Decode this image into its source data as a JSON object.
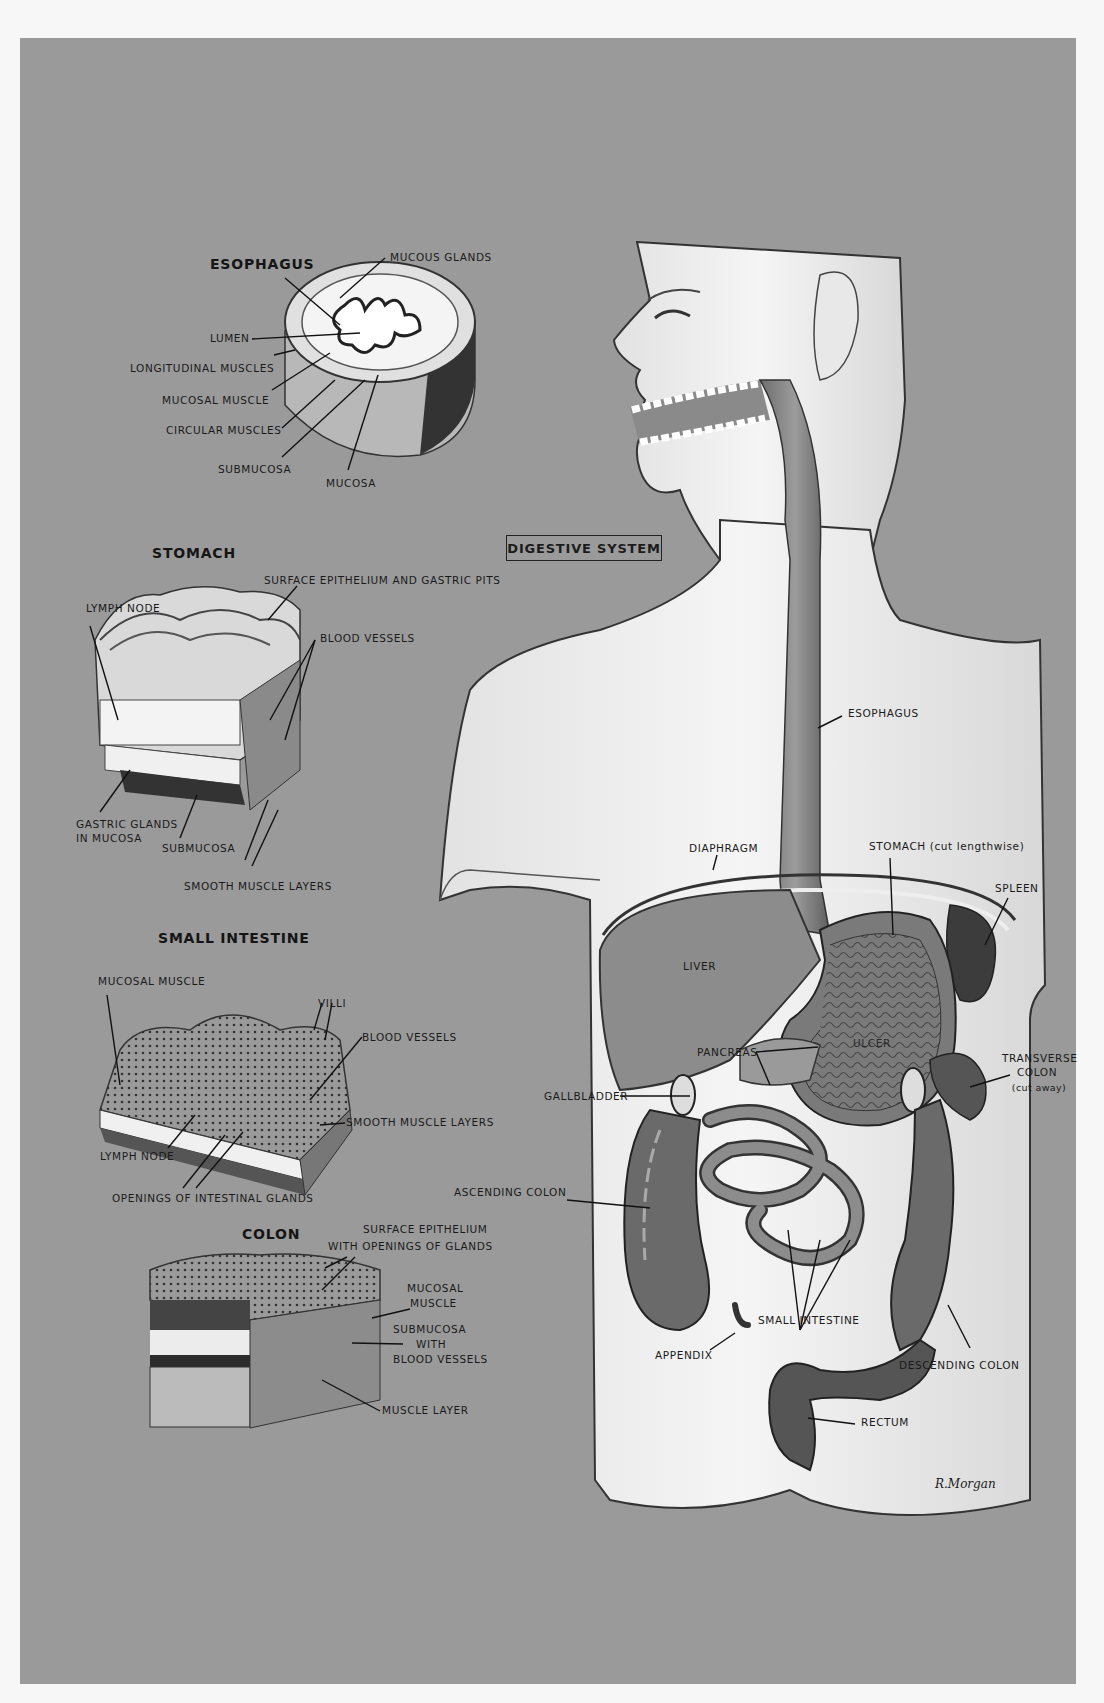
{
  "title": "DIGESTIVE SYSTEM",
  "signature": "R.Morgan",
  "colors": {
    "background_panel": "#9a9a9a",
    "paper": "#f7f7f7",
    "ink": "#1a1a1a"
  },
  "insets": {
    "esophagus": {
      "heading": "ESOPHAGUS",
      "labels": [
        "MUCOUS GLANDS",
        "LUMEN",
        "LONGITUDINAL MUSCLES",
        "MUCOSAL MUSCLE",
        "CIRCULAR MUSCLES",
        "SUBMUCOSA",
        "MUCOSA"
      ]
    },
    "stomach": {
      "heading": "STOMACH",
      "labels": [
        "SURFACE EPITHELIUM AND GASTRIC PITS",
        "LYMPH NODE",
        "BLOOD VESSELS",
        "GASTRIC GLANDS",
        "IN MUCOSA",
        "SUBMUCOSA",
        "SMOOTH MUSCLE LAYERS"
      ]
    },
    "small_intestine": {
      "heading": "SMALL INTESTINE",
      "labels": [
        "MUCOSAL MUSCLE",
        "VILLI",
        "BLOOD VESSELS",
        "SMOOTH MUSCLE LAYERS",
        "LYMPH NODE",
        "OPENINGS OF INTESTINAL GLANDS"
      ]
    },
    "colon": {
      "heading": "COLON",
      "labels": [
        "SURFACE EPITHELIUM",
        "WITH OPENINGS OF GLANDS",
        "MUCOSAL",
        "MUSCLE",
        "SUBMUCOSA",
        "WITH",
        "BLOOD VESSELS",
        "MUSCLE LAYER"
      ]
    }
  },
  "body_labels": {
    "esophagus": "ESOPHAGUS",
    "diaphragm": "DIAPHRAGM",
    "stomach": "STOMACH (cut lengthwise)",
    "spleen": "SPLEEN",
    "liver": "LIVER",
    "pancreas": "PANCREAS",
    "ulcer": "ULCER",
    "transverse_colon": [
      "TRANSVERSE",
      "COLON",
      "(cut away)"
    ],
    "gallbladder": "GALLBLADDER",
    "ascending_colon": "ASCENDING COLON",
    "small_intestine": "SMALL INTESTINE",
    "appendix": "APPENDIX",
    "descending_colon": "DESCENDING COLON",
    "rectum": "RECTUM"
  }
}
